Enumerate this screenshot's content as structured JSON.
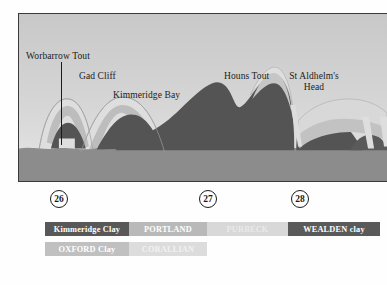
{
  "figure": {
    "frame": {
      "sky_color": "#cfcfcf"
    }
  },
  "section_labels": [
    {
      "id": "worbarrow-tout",
      "text": "Worbarrow Tout",
      "x": 26,
      "y": 52,
      "align": "left"
    },
    {
      "id": "gad-cliff",
      "text": "Gad Cliff",
      "x": 79,
      "y": 72,
      "align": "left"
    },
    {
      "id": "kimmeridge-bay",
      "text": "Kimmeridge Bay",
      "x": 113,
      "y": 90,
      "align": "left"
    },
    {
      "id": "houns-tout",
      "text": "Houns Tout",
      "x": 225,
      "y": 72,
      "align": "left"
    },
    {
      "id": "st-aldhelms-head",
      "text": "St Aldhelm's\nHead",
      "x": 286,
      "y": 72,
      "align": "center"
    }
  ],
  "markers": [
    {
      "label": "26",
      "x": 50,
      "y": 190
    },
    {
      "label": "27",
      "x": 199,
      "y": 190
    },
    {
      "label": "28",
      "x": 291,
      "y": 190
    }
  ],
  "legend": {
    "rows": [
      [
        {
          "label": "Kimmeridge Clay",
          "color": "#585858",
          "text_color": "#ffffff",
          "width": 84
        },
        {
          "label": "PORTLAND",
          "color": "#b9b9b9",
          "text_color": "#ffffff",
          "width": 78
        },
        {
          "label": "PURBECK",
          "color": "#d8d8d8",
          "text_color": "#eaeaea",
          "width": 81
        },
        {
          "label": "WEALDEN clay",
          "color": "#5a5a5a",
          "text_color": "#ffffff",
          "width": 92
        }
      ],
      [
        {
          "label": "OXFORD Clay",
          "color": "#c0c0c0",
          "text_color": "#ffffff",
          "width": 84
        },
        {
          "label": "CORALLIAN",
          "color": "#dcdcdc",
          "text_color": "#f2f2f2",
          "width": 78
        }
      ]
    ]
  },
  "palette": {
    "sky": "#cfcfcf",
    "sky_light": "#dedede",
    "sea_base": "#8c8c8c",
    "kimmeridge_clay": "#545454",
    "wealden_clay": "#5a5a5a",
    "portland": "#b9b9b9",
    "purbeck": "#d6d6d6",
    "corallian": "#dcdcdc",
    "oxford_clay": "#c0c0c0",
    "outline": "#9a9a9a",
    "frame_border": "#3a3a3a",
    "text": "#1b1b1b"
  },
  "chart_data": {
    "type": "area",
    "xlabel": "",
    "ylabel": "",
    "grid": false,
    "legend_position": "below",
    "series": [
      {
        "name": "Kimmeridge Clay",
        "color": "#545454"
      },
      {
        "name": "PORTLAND",
        "color": "#b9b9b9"
      },
      {
        "name": "PURBECK",
        "color": "#d6d6d6"
      },
      {
        "name": "WEALDEN clay",
        "color": "#5a5a5a"
      },
      {
        "name": "OXFORD Clay",
        "color": "#c0c0c0"
      },
      {
        "name": "CORALLIAN",
        "color": "#dcdcdc"
      }
    ],
    "annotations": [
      "Worbarrow Tout",
      "Gad Cliff",
      "Kimmeridge Bay",
      "Houns Tout",
      "St Aldhelm's Head"
    ],
    "markers": [
      "26",
      "27",
      "28"
    ]
  }
}
